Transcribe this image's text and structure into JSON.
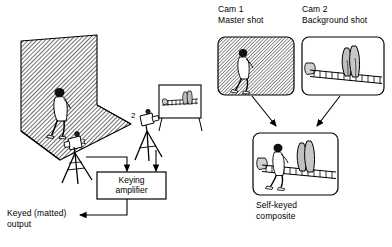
{
  "diagram": {
    "labels": {
      "cam1_line1": "Cam 1",
      "cam1_line2": "Master shot",
      "cam2_line1": "Cam 2",
      "cam2_line2": "Background shot",
      "composite_line1": "Self-keyed",
      "composite_line2": "composite",
      "keying_amp_line1": "Keying",
      "keying_amp_line2": "amplifier",
      "output_line1": "Keyed (matted)",
      "output_line2": "output",
      "camera1_number": "1",
      "camera2_number": "2"
    },
    "monitors": [
      {
        "id": "master-shot",
        "caption_line1": "Cam 1",
        "caption_line2": "Master shot",
        "content": "walking-figure-on-hatched-backdrop"
      },
      {
        "id": "background-shot",
        "caption_line1": "Cam 2",
        "caption_line2": "Background shot",
        "content": "fence-trees-bush-scene"
      },
      {
        "id": "self-keyed-composite",
        "caption_line1": "Self-keyed",
        "caption_line2": "composite",
        "content": "walking-figure-over-fence-scene"
      }
    ],
    "equipment": [
      {
        "id": "camera-1",
        "number": "1",
        "role": "master-shot-camera"
      },
      {
        "id": "camera-2",
        "number": "2",
        "role": "background-shot-camera"
      },
      {
        "id": "keying-amplifier",
        "label": "Keying amplifier"
      },
      {
        "id": "cyclorama",
        "role": "hatched-chroma-key-backdrop"
      },
      {
        "id": "background-panel",
        "role": "painted-background-flat"
      }
    ],
    "colors": {
      "ink": "#000000",
      "paper": "#ffffff",
      "hatch": "#4a4a4a",
      "fill_light": "#d8d8d8",
      "fill_mid": "#b5b5b5"
    }
  }
}
